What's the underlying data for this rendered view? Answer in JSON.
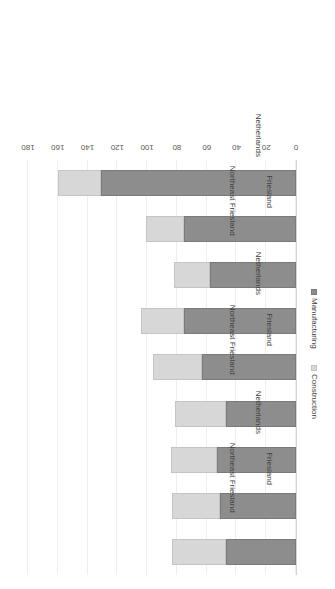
{
  "chart_data": {
    "type": "bar",
    "subtype": "stacked-horizontal-rotated",
    "title": "",
    "subtitle": "",
    "xlabel": "",
    "ylabel": "",
    "ylim": [
      0,
      180
    ],
    "axis_ticks": [
      0,
      20,
      40,
      60,
      80,
      100,
      120,
      140,
      160,
      180
    ],
    "tick_labels": [
      "0",
      "20",
      "40",
      "60",
      "80",
      "100",
      "120",
      "140",
      "160",
      "180"
    ],
    "grid": true,
    "grid_axis": "value",
    "legend_position": "right",
    "orientation": "rotated-180",
    "categories": [
      "Northeast Friesland",
      "Friesland",
      "Netherlands",
      "Northeast Friesland",
      "Friesland",
      "Netherlands",
      "Northeast Friesland",
      "Friesland",
      "Netherlands"
    ],
    "groups": [
      {
        "label": "2008",
        "categories": [
          "Northeast Friesland",
          "Friesland",
          "Netherlands"
        ]
      },
      {
        "label": "1978",
        "categories": [
          "Northeast Friesland",
          "Friesland",
          "Netherlands"
        ]
      },
      {
        "label": "1950",
        "categories": [
          "Northeast Friesland",
          "Friesland",
          "Netherlands"
        ]
      }
    ],
    "series": [
      {
        "name": "Manufacturing",
        "color": "#8d8d8d",
        "values": [
          47,
          51,
          53,
          47,
          63,
          75,
          58,
          75,
          131
        ]
      },
      {
        "name": "Construction",
        "color": "#d7d7d7",
        "values": [
          36,
          32,
          31,
          34,
          33,
          29,
          24,
          26,
          29
        ]
      }
    ],
    "totals": [
      83,
      83,
      84,
      81,
      96,
      104,
      82,
      101,
      160
    ]
  },
  "legend": {
    "items": [
      {
        "label": "Manufacturing",
        "key": "manufacturing"
      },
      {
        "label": "Construction",
        "key": "construction"
      }
    ]
  },
  "colors": {
    "manufacturing": "#8d8d8d",
    "construction": "#d7d7d7",
    "gridline": "#eeeeee",
    "axis": "#d4d4d4",
    "text": "#3f3f3f",
    "tick_text": "#5a5a5a",
    "background": "#ffffff"
  }
}
